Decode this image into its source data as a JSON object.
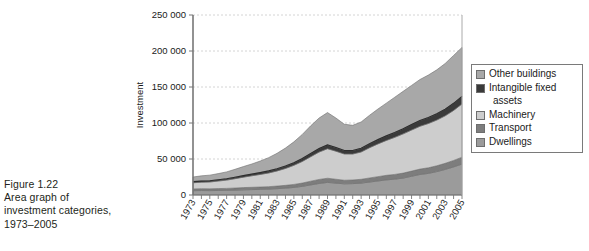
{
  "caption": {
    "lines": [
      "Figure 1.22",
      "Area graph of",
      "investment categories,",
      "1973–2005"
    ]
  },
  "legend": {
    "items": [
      {
        "label": "Other buildings",
        "color": "#a8a8a8"
      },
      {
        "label": "Intangible fixed",
        "label2": "assets",
        "color": "#3a3a3a"
      },
      {
        "label": "Machinery",
        "color": "#cdcdcd"
      },
      {
        "label": "Transport",
        "color": "#7d7d7d"
      },
      {
        "label": "Dwellings",
        "color": "#9b9b9b"
      }
    ]
  },
  "axes": {
    "ylabel": "Investment",
    "yticks": [
      "0",
      "50 000",
      "100 000",
      "150 000",
      "200 000",
      "250 000"
    ],
    "ylim": [
      0,
      250000
    ],
    "xlim": [
      1973,
      2005
    ],
    "xticks": [
      "1973",
      "1975",
      "1977",
      "1979",
      "1981",
      "1983",
      "1985",
      "1987",
      "1989",
      "1991",
      "1993",
      "1995",
      "1997",
      "1999",
      "2001",
      "2003",
      "2005"
    ]
  },
  "chart_data": {
    "type": "area",
    "title": "",
    "xlabel": "",
    "ylabel": "Investment",
    "ylim": [
      0,
      250000
    ],
    "grid": "horizontal-dashed",
    "legend_position": "right",
    "stack_order_bottom_to_top": [
      "Dwellings",
      "Transport",
      "Machinery",
      "Intangible fixed assets",
      "Other buildings"
    ],
    "x": [
      1973,
      1974,
      1975,
      1976,
      1977,
      1978,
      1979,
      1980,
      1981,
      1982,
      1983,
      1984,
      1985,
      1986,
      1987,
      1988,
      1989,
      1990,
      1991,
      1992,
      1993,
      1994,
      1995,
      1996,
      1997,
      1998,
      1999,
      2000,
      2001,
      2002,
      2003,
      2004,
      2005
    ],
    "series": [
      {
        "name": "Dwellings",
        "color": "#9b9b9b",
        "values": [
          6000,
          6200,
          6100,
          6300,
          6500,
          6800,
          7200,
          7500,
          7800,
          8200,
          8800,
          9500,
          10500,
          12000,
          14000,
          16000,
          17500,
          16500,
          15500,
          15800,
          16500,
          18000,
          19500,
          21000,
          22000,
          23500,
          26000,
          28500,
          30000,
          32500,
          35500,
          39000,
          43000
        ]
      },
      {
        "name": "Transport",
        "color": "#7d7d7d",
        "values": [
          2500,
          2600,
          2500,
          2600,
          2700,
          2900,
          3100,
          3200,
          3300,
          3400,
          3600,
          3900,
          4200,
          4600,
          5200,
          5600,
          5800,
          5400,
          5000,
          5100,
          5300,
          5700,
          6000,
          6300,
          6600,
          6900,
          7200,
          7500,
          7800,
          8100,
          8500,
          9000,
          9500
        ]
      },
      {
        "name": "Machinery",
        "color": "#cdcdcd",
        "values": [
          8500,
          9000,
          9500,
          10500,
          11500,
          13000,
          14500,
          16000,
          17500,
          19000,
          21000,
          23500,
          26500,
          30000,
          34000,
          38000,
          41000,
          39000,
          36500,
          36000,
          38000,
          42000,
          45500,
          48500,
          51500,
          54500,
          57000,
          59500,
          61500,
          63500,
          66000,
          69500,
          74000
        ]
      },
      {
        "name": "Intangible fixed assets",
        "color": "#3a3a3a",
        "values": [
          1500,
          1600,
          1700,
          1800,
          1900,
          2000,
          2200,
          2400,
          2600,
          2800,
          3000,
          3300,
          3600,
          4000,
          4400,
          4800,
          5200,
          5000,
          4800,
          4900,
          5100,
          5500,
          5900,
          6300,
          6700,
          7100,
          7500,
          7900,
          8300,
          8700,
          9200,
          9800,
          10500
        ]
      },
      {
        "name": "Other buildings",
        "color": "#a8a8a8",
        "values": [
          6500,
          7200,
          7800,
          8500,
          9500,
          11000,
          12500,
          14000,
          16000,
          18500,
          21500,
          25000,
          29000,
          33500,
          38500,
          42500,
          45000,
          41000,
          36500,
          35000,
          36500,
          39500,
          42500,
          45500,
          49000,
          52000,
          54500,
          57000,
          59000,
          61000,
          63500,
          66500,
          68000
        ]
      }
    ],
    "notes": {
      "total_1973": 25000,
      "total_1989": 114500,
      "total_1992": 96800,
      "total_2005": 205000
    }
  }
}
